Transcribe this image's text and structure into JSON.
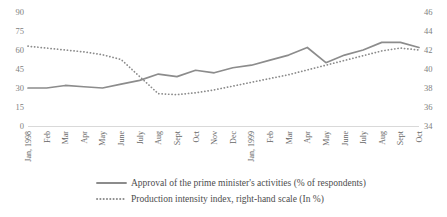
{
  "chart_data": {
    "type": "line",
    "title": "",
    "xlabel": "",
    "ylabel": "",
    "grid": false,
    "legend_position": "bottom",
    "categories": [
      "Jan, 1998",
      "Feb",
      "Mar",
      "Apr",
      "May",
      "June",
      "July",
      "Aug",
      "Sept",
      "Oct",
      "Nov",
      "Dec",
      "Jan, 1999",
      "Feb",
      "Mar",
      "Apr",
      "May",
      "June",
      "July",
      "Aug",
      "Sept",
      "Oct"
    ],
    "axes": {
      "left": {
        "ticks": [
          0,
          15,
          30,
          45,
          60,
          75,
          90
        ],
        "ylim": [
          0,
          90
        ],
        "label": ""
      },
      "right": {
        "ticks": [
          34,
          36,
          38,
          40,
          42,
          44,
          46
        ],
        "ylim": [
          34,
          46
        ],
        "label": ""
      }
    },
    "series": [
      {
        "name": "Approval of the prime minister's activities (% of respondents)",
        "axis": "left",
        "style": "solid",
        "color": "#8c8c8c",
        "values": [
          30,
          30,
          32,
          31,
          30,
          33,
          36,
          41,
          39,
          44,
          42,
          46,
          48,
          52,
          56,
          62,
          50,
          56,
          60,
          66,
          66,
          62
        ]
      },
      {
        "name": "Production intensity index, right-hand scale (In %)",
        "axis": "right",
        "style": "dotted",
        "color": "#8c8c8c",
        "values": [
          42.4,
          42.2,
          42.0,
          41.8,
          41.5,
          41.0,
          39.2,
          37.4,
          37.3,
          37.5,
          37.8,
          38.2,
          38.6,
          39.0,
          39.4,
          39.9,
          40.4,
          40.9,
          41.4,
          41.9,
          42.2,
          42.0
        ]
      }
    ]
  },
  "legend": {
    "items": [
      {
        "label": "Approval of the prime minister's activities (% of respondents)",
        "marker": "solid-line-swatch"
      },
      {
        "label": "Production intensity index, right-hand scale (In %)",
        "marker": "dotted-line-swatch"
      }
    ]
  }
}
